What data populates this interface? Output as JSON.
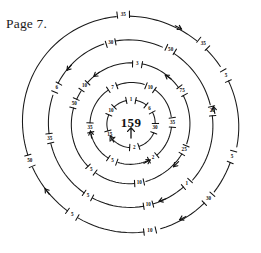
{
  "page": {
    "page_label": "Page 7.",
    "background_color": "#ffffff",
    "ink_color": "#111111"
  },
  "diagram": {
    "type": "concentric-ring-tick-diagram",
    "center": {
      "x": 131,
      "y": 124,
      "label": "159"
    },
    "ring_count": 5,
    "rings": [
      {
        "index": 1,
        "name": "ring-1-innermost",
        "radius": 24,
        "ticks": [
          {
            "label": "1",
            "angle": -90
          },
          {
            "label": "6",
            "angle": -40
          },
          {
            "label": "30",
            "angle": 10
          },
          {
            "label": "2",
            "angle": 82
          },
          {
            "label": "15",
            "angle": 152
          },
          {
            "label": "10",
            "angle": -146
          }
        ]
      },
      {
        "index": 2,
        "name": "ring-2",
        "radius": 41,
        "ticks": [
          {
            "label": "7",
            "angle": -117
          },
          {
            "label": "10",
            "angle": -62
          },
          {
            "label": "35",
            "angle": -2
          },
          {
            "label": "2",
            "angle": 57
          },
          {
            "label": "5",
            "angle": 117
          },
          {
            "label": "35",
            "angle": 175
          }
        ]
      },
      {
        "index": 3,
        "name": "ring-3",
        "radius": 60,
        "ticks": [
          {
            "label": "3",
            "angle": -84
          },
          {
            "label": "75",
            "angle": -33
          },
          {
            "label": "25",
            "angle": 26
          },
          {
            "label": "10",
            "angle": 82
          },
          {
            "label": "5",
            "angle": 131
          },
          {
            "label": "10",
            "angle": -141
          },
          {
            "label": "50",
            "angle": -160
          }
        ]
      },
      {
        "index": 4,
        "name": "ring-4",
        "radius": 83,
        "ticks": [
          {
            "label": "30",
            "angle": -104
          },
          {
            "label": "50",
            "angle": -62
          },
          {
            "label": "20",
            "angle": -9
          },
          {
            "label": "1",
            "angle": 47
          },
          {
            "label": "10",
            "angle": 78
          },
          {
            "label": "5",
            "angle": 121
          },
          {
            "label": "35",
            "angle": 170
          },
          {
            "label": "6",
            "angle": -154
          }
        ]
      },
      {
        "index": 5,
        "name": "ring-5-outermost",
        "radius": 108,
        "ticks": [
          {
            "label": "35",
            "angle": -94
          },
          {
            "label": "35",
            "angle": -48
          },
          {
            "label": "5",
            "angle": -27
          },
          {
            "label": "5",
            "angle": 18
          },
          {
            "label": "30",
            "angle": 44
          },
          {
            "label": "10",
            "angle": 80
          },
          {
            "label": "5",
            "angle": 123
          },
          {
            "label": "50",
            "angle": 160
          }
        ]
      }
    ],
    "center_arrow": {
      "direction": "up",
      "name": "center-up-arrow"
    },
    "arrow_markers": [
      {
        "name": "arrow-ring5-top-right",
        "angle": -62,
        "radius": 108,
        "direction": "clockwise"
      },
      {
        "name": "arrow-ring5-bottom",
        "angle": 63,
        "radius": 108,
        "direction": "clockwise"
      },
      {
        "name": "arrow-ring5-bottom-left",
        "angle": 143,
        "radius": 108,
        "direction": "clockwise"
      },
      {
        "name": "arrow-ring4-top-left",
        "angle": -140,
        "radius": 83,
        "direction": "counter-clockwise"
      },
      {
        "name": "arrow-ring4-right",
        "angle": -12,
        "radius": 83,
        "direction": "counter-clockwise"
      },
      {
        "name": "arrow-ring4-bottom",
        "angle": 70,
        "radius": 83,
        "direction": "clockwise"
      },
      {
        "name": "arrow-ring3-top-left",
        "angle": -128,
        "radius": 60,
        "direction": "counter-clockwise"
      },
      {
        "name": "arrow-ring3-top-right",
        "angle": -55,
        "radius": 60,
        "direction": "counter-clockwise"
      },
      {
        "name": "arrow-ring3-bottom-right",
        "angle": 45,
        "radius": 60,
        "direction": "clockwise"
      },
      {
        "name": "arrow-ring2-left",
        "angle": 170,
        "radius": 41,
        "direction": "clockwise"
      },
      {
        "name": "arrow-ring2-bottom",
        "angle": 62,
        "radius": 41,
        "direction": "counter-clockwise"
      },
      {
        "name": "arrow-ring1-left",
        "angle": 150,
        "radius": 24,
        "direction": "clockwise"
      }
    ]
  }
}
